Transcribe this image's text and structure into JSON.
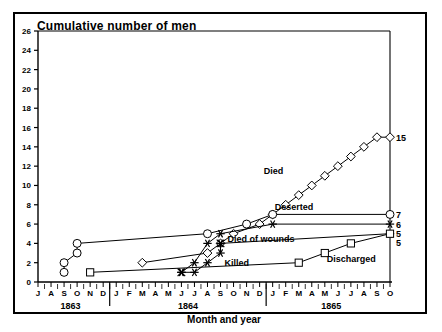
{
  "figure": {
    "title": "Cumulative number of men",
    "x_axis_label": "Month and year"
  },
  "chart_data": {
    "type": "line",
    "title": "Cumulative number of men",
    "xlabel": "Month and year",
    "ylabel": "Cumulative number of men",
    "ylim": [
      0,
      26
    ],
    "ytick_labels": [
      "0",
      "2",
      "4",
      "6",
      "8",
      "10",
      "12",
      "14",
      "16",
      "18",
      "20",
      "22",
      "24",
      "26"
    ],
    "ytick_values": [
      0,
      2,
      4,
      6,
      8,
      10,
      12,
      14,
      16,
      18,
      20,
      22,
      24,
      26
    ],
    "grid": false,
    "legend": "inline-labels",
    "x_month_ticks": [
      "J",
      "A",
      "S",
      "O",
      "N",
      "D",
      "J",
      "F",
      "M",
      "A",
      "M",
      "J",
      "J",
      "A",
      "S",
      "O",
      "N",
      "D",
      "J",
      "F",
      "M",
      "A",
      "M",
      "J",
      "J",
      "A",
      "S",
      "O"
    ],
    "year_groups": [
      {
        "label": "1863",
        "months": [
          "J",
          "A",
          "S",
          "O",
          "N",
          "D"
        ]
      },
      {
        "label": "1864",
        "months": [
          "J",
          "F",
          "M",
          "A",
          "M",
          "J",
          "J",
          "A",
          "S",
          "O",
          "N",
          "D"
        ]
      },
      {
        "label": "1865",
        "months": [
          "J",
          "F",
          "M",
          "A",
          "M",
          "J",
          "J",
          "A",
          "S",
          "O"
        ]
      }
    ],
    "x_start": "1863-07",
    "x_end": "1865-10",
    "series": [
      {
        "name": "Died",
        "marker": "diamond",
        "end_value": 15,
        "x": [
          "1864-03",
          "1864-08",
          "1864-09",
          "1864-10",
          "1864-12",
          "1865-01",
          "1865-02",
          "1865-03",
          "1865-04",
          "1865-05",
          "1865-06",
          "1865-07",
          "1865-08",
          "1865-09",
          "1865-10"
        ],
        "values": [
          2,
          3,
          4,
          5,
          6,
          7,
          8,
          9,
          10,
          11,
          12,
          13,
          14,
          15,
          15
        ]
      },
      {
        "name": "Deserted",
        "marker": "circle",
        "end_value": 7,
        "x": [
          "1863-09",
          "1863-09",
          "1863-10",
          "1863-10",
          "1864-08",
          "1864-11",
          "1865-01",
          "1865-10"
        ],
        "values": [
          1,
          2,
          3,
          4,
          5,
          6,
          7,
          7
        ]
      },
      {
        "name": "Died of wounds",
        "marker": "asterisk",
        "end_value": 6,
        "x": [
          "1864-06",
          "1864-07",
          "1864-08",
          "1864-09",
          "1865-01",
          "1865-10"
        ],
        "values": [
          1,
          2,
          4,
          5,
          6,
          6
        ]
      },
      {
        "name": "Killed",
        "marker": "asterisk",
        "end_value": 5,
        "x": [
          "1864-06",
          "1864-07",
          "1864-08",
          "1864-09",
          "1864-09",
          "1865-10"
        ],
        "values": [
          1,
          1,
          2,
          3,
          4,
          5
        ]
      },
      {
        "name": "Discharged",
        "marker": "square",
        "end_value": 5,
        "x": [
          "1863-11",
          "1865-03",
          "1865-05",
          "1865-07",
          "1865-10"
        ],
        "values": [
          1,
          2,
          3,
          4,
          5
        ]
      }
    ],
    "end_value_labels": [
      "15",
      "7",
      "6",
      "5"
    ],
    "inline_labels": [
      {
        "text": "Died",
        "series": "Died"
      },
      {
        "text": "Deserted",
        "series": "Deserted"
      },
      {
        "text": "Died of wounds",
        "series": "Died of wounds"
      },
      {
        "text": "Killed",
        "series": "Killed"
      },
      {
        "text": "Discharged",
        "series": "Discharged"
      }
    ]
  }
}
